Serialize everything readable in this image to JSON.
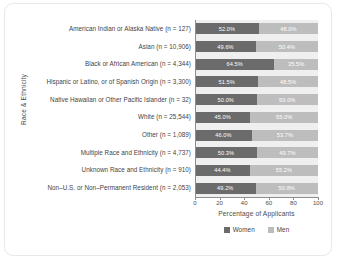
{
  "chart_data": {
    "type": "bar",
    "subtype": "stacked-horizontal-100",
    "title": "",
    "xlabel": "Percentage of Applicants",
    "ylabel": "Race & Ethnicity",
    "xlim": [
      0,
      100
    ],
    "xticks": [
      "0",
      "20",
      "40",
      "60",
      "80",
      "100"
    ],
    "grid": false,
    "legend_position": "bottom",
    "categories": [
      "American Indian or Alaska Native (n = 127)",
      "Asian (n = 10,906)",
      "Black or African American (n = 4,344)",
      "Hispanic or Latino, or of Spanish Origin (n = 3,300)",
      "Native Hawaiian or Other Pacific Islander (n = 32)",
      "White (n = 25,544)",
      "Other (n = 1,089)",
      "Multiple Race and Ethnicity (n = 4,737)",
      "Unknown Race and Ethnicity (n = 910)",
      "Non–U.S. or Non–Permanent Resident (n = 2,053)"
    ],
    "series": [
      {
        "name": "Women",
        "color": "#6b6b6b",
        "values": [
          52.0,
          49.6,
          64.5,
          51.5,
          50.0,
          45.0,
          46.0,
          50.3,
          44.4,
          49.2
        ],
        "labels": [
          "52.0%",
          "49.6%",
          "64.5%",
          "51.5%",
          "50.0%",
          "45.0%",
          "46.0%",
          "50.3%",
          "44.4%",
          "49.2%"
        ]
      },
      {
        "name": "Men",
        "color": "#bdbdbd",
        "values": [
          48.0,
          50.4,
          35.5,
          48.5,
          50.0,
          55.0,
          53.7,
          49.7,
          55.2,
          50.8
        ],
        "labels": [
          "48.0%",
          "50.4%",
          "35.5%",
          "48.5%",
          "50.0%",
          "55.0%",
          "53.7%",
          "49.7%",
          "55.2%",
          "50.8%"
        ]
      }
    ]
  },
  "legend": {
    "items": [
      {
        "label": "Women",
        "color": "#6b6b6b"
      },
      {
        "label": "Men",
        "color": "#bdbdbd"
      }
    ]
  }
}
